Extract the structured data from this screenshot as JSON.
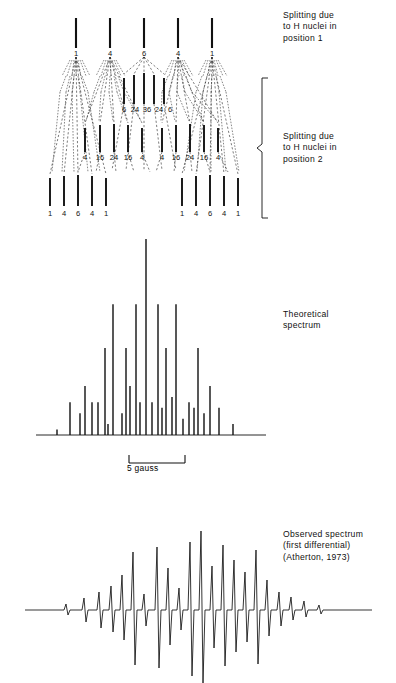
{
  "figure": {
    "ink_color": "#111111",
    "background": "#ffffff"
  },
  "annotations": {
    "splitting_position_1": "Splitting due\nto H nuclei in\nposition 1",
    "splitting_position_2": "Splitting due\nto H nuclei in\nposition 2",
    "theoretical_spectrum": "Theoretical\nspectrum",
    "observed_spectrum": "Observed spectrum\n(first differential)\n(Atherton, 1973)",
    "scale_bar_label": "5 gauss"
  },
  "chart_data": {
    "type": "bar",
    "xlabel": "Magnetic field (gauss)",
    "ylabel": "Relative intensity",
    "grid": false,
    "legend": "none",
    "scale_bar": {
      "label": "5 gauss",
      "value": 5,
      "units": "gauss",
      "pixel_length": 56
    },
    "tree": {
      "levels": [
        {
          "name": "level-1",
          "label": "Splitting due to H nuclei in position 1",
          "y_top": 18,
          "y_bottom": 48,
          "lines": [
            {
              "x": 76,
              "intensity": 1,
              "label": "1"
            },
            {
              "x": 110,
              "intensity": 4,
              "label": "4"
            },
            {
              "x": 144,
              "intensity": 6,
              "label": "6"
            },
            {
              "x": 178,
              "intensity": 4,
              "label": "4"
            },
            {
              "x": 212,
              "intensity": 1,
              "label": "1"
            }
          ]
        },
        {
          "name": "level-2",
          "label": "Splitting due to H nuclei in position 2 (central group shown)",
          "y_top": 75,
          "y_bottom": 104,
          "lines": [
            {
              "x": 124,
              "intensity": 6,
              "label": "6"
            },
            {
              "x": 134,
              "intensity": 24,
              "label": "24"
            },
            {
              "x": 144,
              "intensity": 36,
              "label": "36"
            },
            {
              "x": 154,
              "intensity": 24,
              "label": "24"
            },
            {
              "x": 164,
              "intensity": 6,
              "label": "6"
            }
          ]
        },
        {
          "name": "level-3",
          "label": "Second-order groups",
          "y_top": 124,
          "y_bottom": 152,
          "lines": [
            {
              "x": 85,
              "intensity": 4,
              "label": "4"
            },
            {
              "x": 100,
              "intensity": 16,
              "label": "16"
            },
            {
              "x": 114,
              "intensity": 24,
              "label": "24"
            },
            {
              "x": 128,
              "intensity": 16,
              "label": "16"
            },
            {
              "x": 142,
              "intensity": 4,
              "label": "4"
            },
            {
              "x": 162,
              "intensity": 4,
              "label": "4"
            },
            {
              "x": 176,
              "intensity": 16,
              "label": "16"
            },
            {
              "x": 190,
              "intensity": 24,
              "label": "24"
            },
            {
              "x": 204,
              "intensity": 16,
              "label": "16"
            },
            {
              "x": 218,
              "intensity": 4,
              "label": "4"
            }
          ]
        },
        {
          "name": "level-4",
          "label": "Outer quintets",
          "y_top": 175,
          "y_bottom": 206,
          "lines": [
            {
              "x": 50,
              "intensity": 1,
              "label": "1"
            },
            {
              "x": 64,
              "intensity": 4,
              "label": "4"
            },
            {
              "x": 78,
              "intensity": 6,
              "label": "6"
            },
            {
              "x": 92,
              "intensity": 4,
              "label": "4"
            },
            {
              "x": 106,
              "intensity": 1,
              "label": "1"
            },
            {
              "x": 182,
              "intensity": 1,
              "label": "1"
            },
            {
              "x": 196,
              "intensity": 4,
              "label": "4"
            },
            {
              "x": 210,
              "intensity": 6,
              "label": "6"
            },
            {
              "x": 224,
              "intensity": 4,
              "label": "4"
            },
            {
              "x": 238,
              "intensity": 1,
              "label": "1"
            }
          ]
        }
      ]
    },
    "theoretical_stick_spectrum": {
      "baseline_y": 435,
      "x_range": [
        35,
        265
      ],
      "intensity_max": 36,
      "sticks": [
        {
          "x": 57,
          "intensity": 1
        },
        {
          "x": 70,
          "intensity": 6
        },
        {
          "x": 80,
          "intensity": 4
        },
        {
          "x": 85,
          "intensity": 9
        },
        {
          "x": 92,
          "intensity": 6
        },
        {
          "x": 98,
          "intensity": 6
        },
        {
          "x": 105,
          "intensity": 16
        },
        {
          "x": 108,
          "intensity": 2
        },
        {
          "x": 113,
          "intensity": 24
        },
        {
          "x": 122,
          "intensity": 4
        },
        {
          "x": 126,
          "intensity": 16
        },
        {
          "x": 130,
          "intensity": 9
        },
        {
          "x": 136,
          "intensity": 24
        },
        {
          "x": 140,
          "intensity": 6
        },
        {
          "x": 146,
          "intensity": 36
        },
        {
          "x": 152,
          "intensity": 6
        },
        {
          "x": 158,
          "intensity": 24
        },
        {
          "x": 162,
          "intensity": 5
        },
        {
          "x": 166,
          "intensity": 16
        },
        {
          "x": 172,
          "intensity": 7
        },
        {
          "x": 176,
          "intensity": 24
        },
        {
          "x": 183,
          "intensity": 3
        },
        {
          "x": 189,
          "intensity": 6
        },
        {
          "x": 194,
          "intensity": 5
        },
        {
          "x": 198,
          "intensity": 16
        },
        {
          "x": 204,
          "intensity": 4
        },
        {
          "x": 210,
          "intensity": 9
        },
        {
          "x": 219,
          "intensity": 5
        },
        {
          "x": 233,
          "intensity": 2
        }
      ]
    },
    "observed_derivative_spectrum": {
      "baseline_y": 610,
      "x_range": [
        25,
        270
      ],
      "description": "First-derivative ESR trace with ~29 hyperfine lines, largest at centre"
    }
  }
}
